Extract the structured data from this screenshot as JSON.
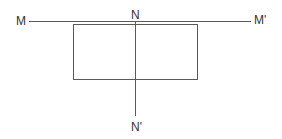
{
  "diagram": {
    "type": "geometric-projection",
    "colors": {
      "stroke": "#5a5a5a",
      "text": "#333333",
      "background": "#ffffff"
    },
    "labels": {
      "m": "M",
      "m_prime": "M'",
      "n": "N",
      "n_prime": "N'"
    },
    "lines": [
      {
        "name": "horizontal-line-MM'",
        "from": "M",
        "to": "M'"
      },
      {
        "name": "vertical-line-NN'",
        "from": "N",
        "to": "N'"
      }
    ],
    "shapes": [
      {
        "name": "rectangle",
        "bisected_by": "NN'"
      }
    ]
  }
}
